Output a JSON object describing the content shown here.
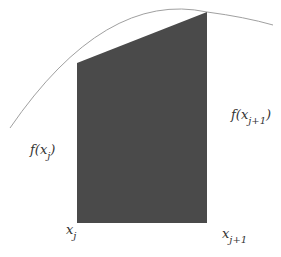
{
  "diagram": {
    "type": "trapezoid-rule-illustration",
    "colors": {
      "curve": "#a0a0a0",
      "fill": "#4a4a4a",
      "text": "#333333"
    },
    "labels": {
      "f_left": {
        "func": "f(x",
        "sub": "j",
        "close": ")"
      },
      "f_right": {
        "func": "f(x",
        "sub": "j+1",
        "close": ")"
      },
      "x_left": {
        "var": "x",
        "sub": "j"
      },
      "x_right": {
        "var": "x",
        "sub": "j+1"
      }
    }
  }
}
